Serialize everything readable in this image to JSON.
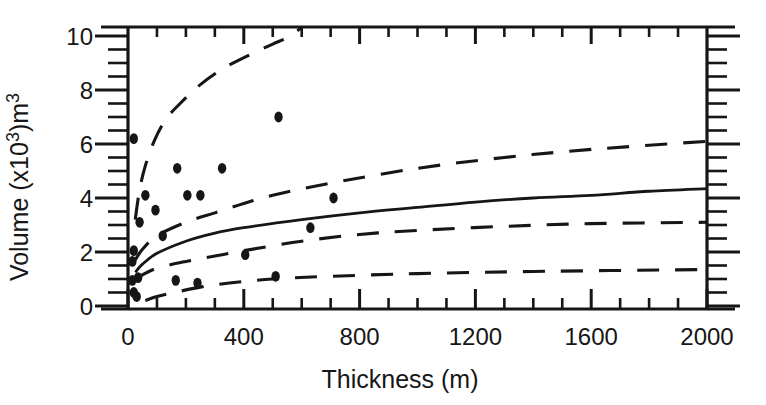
{
  "figure": {
    "background": "#ffffff",
    "ink_color": "#161616"
  },
  "chart_data": {
    "type": "scatter",
    "title": "",
    "xlabel": "Thickness (m)",
    "ylabel": "Volume (x10³)m³",
    "ylabel_rich": [
      {
        "t": "Volume (x10",
        "sup": false
      },
      {
        "t": "3",
        "sup": true
      },
      {
        "t": ")m",
        "sup": false
      },
      {
        "t": "3",
        "sup": true
      }
    ],
    "xlim": [
      0,
      2000
    ],
    "ylim": [
      0,
      10
    ],
    "grid": false,
    "legend_position": "none",
    "x_major_ticks": [
      0,
      400,
      800,
      1200,
      1600,
      2000
    ],
    "x_tick_labels": [
      "0",
      "400",
      "800",
      "1200",
      "1600",
      "2000"
    ],
    "x_minor_step": 100,
    "y_major_ticks": [
      0,
      2,
      4,
      6,
      8,
      10
    ],
    "y_tick_labels": [
      "0",
      "2",
      "4",
      "6",
      "8",
      "10"
    ],
    "y_minor_step": 0.5,
    "scatter_points": [
      [
        20,
        6.2
      ],
      [
        520,
        7.0
      ],
      [
        170,
        5.1
      ],
      [
        325,
        5.1
      ],
      [
        60,
        4.1
      ],
      [
        205,
        4.1
      ],
      [
        250,
        4.1
      ],
      [
        710,
        4.0
      ],
      [
        95,
        3.55
      ],
      [
        40,
        3.1
      ],
      [
        630,
        2.9
      ],
      [
        120,
        2.6
      ],
      [
        20,
        2.05
      ],
      [
        405,
        1.9
      ],
      [
        15,
        1.65
      ],
      [
        35,
        1.05
      ],
      [
        15,
        0.95
      ],
      [
        165,
        0.95
      ],
      [
        240,
        0.85
      ],
      [
        510,
        1.1
      ],
      [
        20,
        0.5
      ],
      [
        30,
        0.35
      ]
    ],
    "series": [
      {
        "name": "regression-fit",
        "style": "solid",
        "points": [
          [
            25,
            1.25
          ],
          [
            50,
            1.55
          ],
          [
            100,
            1.95
          ],
          [
            200,
            2.4
          ],
          [
            300,
            2.7
          ],
          [
            400,
            2.9
          ],
          [
            600,
            3.2
          ],
          [
            800,
            3.45
          ],
          [
            1000,
            3.65
          ],
          [
            1200,
            3.85
          ],
          [
            1400,
            4.0
          ],
          [
            1600,
            4.1
          ],
          [
            1800,
            4.25
          ],
          [
            2000,
            4.35
          ]
        ]
      },
      {
        "name": "upper-prediction-band",
        "style": "dashed",
        "points": [
          [
            25,
            3.2
          ],
          [
            40,
            4.3
          ],
          [
            60,
            5.2
          ],
          [
            90,
            6.1
          ],
          [
            130,
            6.9
          ],
          [
            180,
            7.5
          ],
          [
            250,
            8.2
          ],
          [
            330,
            8.8
          ],
          [
            420,
            9.3
          ],
          [
            500,
            9.7
          ],
          [
            560,
            10.0
          ],
          [
            615,
            10.45
          ]
        ]
      },
      {
        "name": "upper-confidence-band",
        "style": "dashed",
        "points": [
          [
            25,
            1.7
          ],
          [
            50,
            2.1
          ],
          [
            100,
            2.6
          ],
          [
            200,
            3.1
          ],
          [
            300,
            3.45
          ],
          [
            400,
            3.8
          ],
          [
            500,
            4.1
          ],
          [
            700,
            4.55
          ],
          [
            1000,
            5.1
          ],
          [
            1300,
            5.5
          ],
          [
            1600,
            5.8
          ],
          [
            2000,
            6.1
          ]
        ]
      },
      {
        "name": "lower-confidence-band",
        "style": "dashed",
        "points": [
          [
            25,
            0.95
          ],
          [
            50,
            1.15
          ],
          [
            100,
            1.4
          ],
          [
            200,
            1.65
          ],
          [
            300,
            1.85
          ],
          [
            400,
            2.05
          ],
          [
            600,
            2.4
          ],
          [
            800,
            2.65
          ],
          [
            1000,
            2.8
          ],
          [
            1300,
            2.95
          ],
          [
            1600,
            3.05
          ],
          [
            2000,
            3.1
          ]
        ]
      },
      {
        "name": "lower-prediction-band",
        "style": "dashed",
        "points": [
          [
            60,
            0.2
          ],
          [
            100,
            0.35
          ],
          [
            160,
            0.5
          ],
          [
            250,
            0.7
          ],
          [
            350,
            0.85
          ],
          [
            500,
            1.0
          ],
          [
            700,
            1.1
          ],
          [
            1000,
            1.2
          ],
          [
            1400,
            1.28
          ],
          [
            2000,
            1.35
          ]
        ]
      }
    ]
  }
}
